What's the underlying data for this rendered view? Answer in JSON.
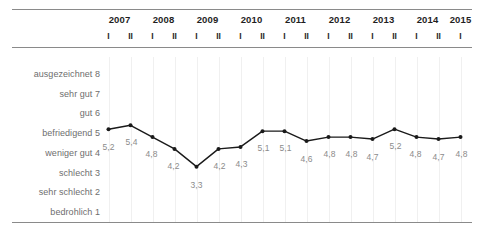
{
  "chart_data": {
    "type": "line",
    "title": "",
    "subtitle": "",
    "xlabel": "",
    "ylabel": "",
    "ylim": [
      1,
      8
    ],
    "grid": true,
    "legend": null,
    "categories": [
      "2007 I",
      "2007 II",
      "2008 I",
      "2008 II",
      "2009 I",
      "2009 II",
      "2010 I",
      "2010 II",
      "2011 I",
      "2011 II",
      "2012 I",
      "2012 II",
      "2013 I",
      "2013 II",
      "2014 I",
      "2014 II",
      "2015 I"
    ],
    "values": [
      5.2,
      5.4,
      4.8,
      4.2,
      3.3,
      4.2,
      4.3,
      5.1,
      5.1,
      4.6,
      4.8,
      4.8,
      4.7,
      5.2,
      4.8,
      4.7,
      4.8
    ],
    "point_labels": [
      "5,2",
      "5,4",
      "4,8",
      "4,2",
      "3,3",
      "4,2",
      "4,3",
      "5,1",
      "5,1",
      "4,6",
      "4,8",
      "4,8",
      "4,7",
      "5,2",
      "4,8",
      "4,7",
      "4,8"
    ],
    "series_color": "#1a1a1a",
    "label_color": "#8b8b8b",
    "grid_color": "#f0f0f0"
  },
  "header": {
    "years": [
      "2007",
      "2008",
      "2009",
      "2010",
      "2011",
      "2012",
      "2013",
      "2014",
      "2015"
    ],
    "halves": [
      "I",
      "II",
      "I",
      "II",
      "I",
      "II",
      "I",
      "II",
      "I",
      "II",
      "I",
      "II",
      "I",
      "II",
      "I",
      "II",
      "I"
    ]
  },
  "yaxis": {
    "ticks": [
      {
        "label": "ausgezeichnet 8",
        "value": 8
      },
      {
        "label": "sehr gut 7",
        "value": 7
      },
      {
        "label": "gut 6",
        "value": 6
      },
      {
        "label": "befriedigend 5",
        "value": 5
      },
      {
        "label": "weniger gut 4",
        "value": 4
      },
      {
        "label": "schlecht 3",
        "value": 3
      },
      {
        "label": "sehr schlecht 2",
        "value": 2
      },
      {
        "label": "bedrohlich 1",
        "value": 1
      }
    ]
  }
}
